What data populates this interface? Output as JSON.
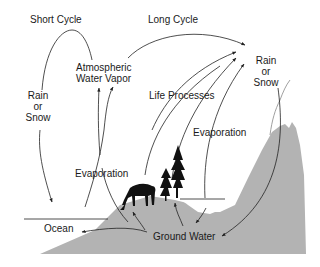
{
  "diagram": {
    "labels": {
      "short_cycle": "Short Cycle",
      "long_cycle": "Long Cycle",
      "atmospheric_line1": "Atmospheric",
      "atmospheric_line2": "Water Vapor",
      "rain_left_1": "Rain",
      "rain_left_2": "or",
      "rain_left_3": "Snow",
      "rain_right_1": "Rain",
      "rain_right_2": "or",
      "rain_right_3": "Snow",
      "life_processes": "Life Processes",
      "evaporation_left": "Evaporation",
      "evaporation_right": "Evaporation",
      "ocean": "Ocean",
      "ground_water": "Ground Water"
    },
    "colors": {
      "land": "#b3b3b3",
      "line": "#222222",
      "silhouette": "#111111"
    }
  }
}
